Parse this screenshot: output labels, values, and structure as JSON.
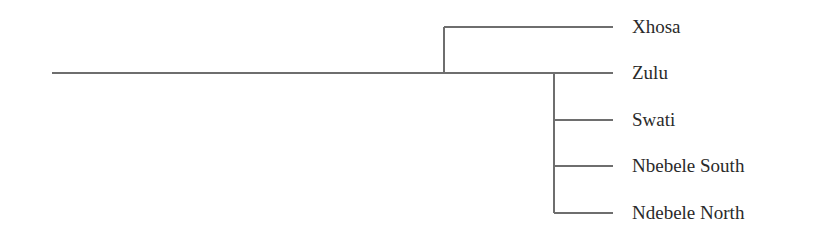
{
  "diagram": {
    "type": "tree",
    "line_color": "#6e6e6e",
    "text_color": "#2a2a2a",
    "root_line": {
      "x1": 52,
      "x2": 444,
      "y": 73
    },
    "clades": [
      {
        "name": "clade-xhosa-zulu",
        "node_x": 444,
        "children": [
          "Xhosa",
          "Zulu"
        ]
      },
      {
        "name": "clade-zulu-group",
        "node_x": 554,
        "children": [
          "Zulu",
          "Swati",
          "Nbebele South",
          "Ndebele North"
        ]
      }
    ],
    "leaves": [
      {
        "label": "Xhosa",
        "y": 27,
        "x_start": 444
      },
      {
        "label": "Zulu",
        "y": 73,
        "x_start": 444
      },
      {
        "label": "Swati",
        "y": 120,
        "x_start": 554
      },
      {
        "label": "Nbebele South",
        "y": 166,
        "x_start": 554
      },
      {
        "label": "Ndebele North",
        "y": 213,
        "x_start": 554
      }
    ],
    "leaf_line_end_x": 613
  }
}
